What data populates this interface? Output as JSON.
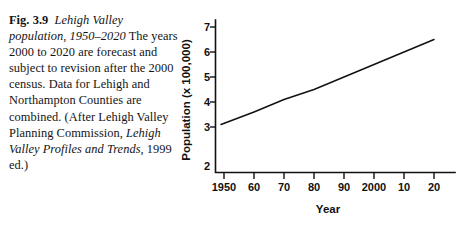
{
  "caption": {
    "fig_number": "Fig. 3.9",
    "title": "Lehigh Valley population, 1950–2020",
    "body_part_1": "The years 2000 to 2020 are forecast and subject to revision after the 2000 census. Data for Lehigh and Northampton Counties are combined. (After Lehigh Valley Planning Commission, ",
    "source_italic": "Lehigh Valley Profiles and Trends",
    "body_part_2": ", 1999 ed.)"
  },
  "chart_data": {
    "type": "line",
    "title": "Lehigh Valley population, 1950–2020",
    "xlabel": "Year",
    "ylabel": "Population (x 100,000)",
    "x_tick_labels": [
      "1950",
      "60",
      "70",
      "80",
      "90",
      "2000",
      "10",
      "20"
    ],
    "x_tick_values": [
      1950,
      1960,
      1970,
      1980,
      1990,
      2000,
      2010,
      2020
    ],
    "y_tick_labels": [
      "2",
      "3",
      "4",
      "5",
      "6",
      "7"
    ],
    "y_tick_values": [
      2,
      3,
      4,
      5,
      6,
      7
    ],
    "xlim": [
      1945,
      2025
    ],
    "ylim": [
      2,
      7.4
    ],
    "grid": false,
    "legend": false,
    "series": [
      {
        "name": "Lehigh Valley population",
        "x": [
          1949,
          1960,
          1970,
          1980,
          1990,
          2000,
          2010,
          2020
        ],
        "values": [
          3.1,
          3.6,
          4.1,
          4.5,
          5.0,
          5.5,
          6.0,
          6.5
        ]
      }
    ],
    "axis_colors": {
      "line": "#111111",
      "data": "#111111"
    }
  }
}
